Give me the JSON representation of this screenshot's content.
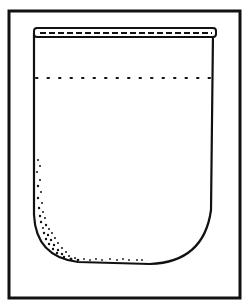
{
  "figure": {
    "colors": {
      "ink": "#111111",
      "background": "#ffffff"
    }
  }
}
